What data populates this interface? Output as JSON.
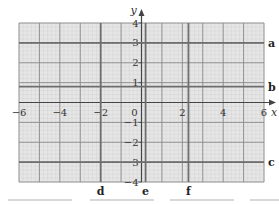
{
  "chart_data": {
    "type": "line",
    "title": "",
    "xlabel": "x",
    "ylabel": "y",
    "xlim": [
      -6,
      6
    ],
    "ylim": [
      -4,
      4
    ],
    "grid": true,
    "x_ticks": [
      -6,
      -4,
      -2,
      0,
      2,
      4,
      6
    ],
    "x_tick_labels": [
      "−6",
      "−4",
      "−2",
      "0",
      "2",
      "4",
      "6"
    ],
    "y_ticks": [
      4,
      3,
      2,
      1,
      -1,
      -2,
      -3,
      -4
    ],
    "y_tick_labels": [
      "4",
      "3",
      "2",
      "1",
      "−1",
      "−2",
      "−3",
      "−4"
    ],
    "origin_label": "0",
    "series": [
      {
        "name": "a",
        "orientation": "horizontal",
        "y": 3.0
      },
      {
        "name": "b",
        "orientation": "horizontal",
        "y": 0.8
      },
      {
        "name": "c",
        "orientation": "horizontal",
        "y": -3.0
      },
      {
        "name": "d",
        "orientation": "vertical",
        "x": -2.0
      },
      {
        "name": "e",
        "orientation": "vertical",
        "x": 0.2
      },
      {
        "name": "f",
        "orientation": "vertical",
        "x": 2.3
      }
    ],
    "colors": {
      "grid_fill": "#e6e6e6",
      "minor_grid": "#cfcfcf",
      "major_grid": "#8a8a8a",
      "line": "#6e6e6e",
      "axis": "#444444"
    }
  }
}
